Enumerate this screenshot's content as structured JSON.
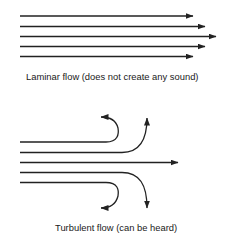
{
  "diagram": {
    "laminar": {
      "caption": "Laminar flow (does not create any sound)",
      "lines": [
        {
          "x1": 20,
          "y": 16,
          "x2": 193
        },
        {
          "x1": 20,
          "y": 26.5,
          "x2": 205
        },
        {
          "x1": 20,
          "y": 36.5,
          "x2": 216
        },
        {
          "x1": 20,
          "y": 46.5,
          "x2": 205
        },
        {
          "x1": 20,
          "y": 56.5,
          "x2": 193
        }
      ]
    },
    "turbulent": {
      "caption": "Turbulent flow (can be heard)",
      "streams": [
        {
          "type": "curl-up-back",
          "start_y": 142
        },
        {
          "type": "curve-up",
          "start_y": 152.5
        },
        {
          "type": "straight",
          "start_y": 162.5
        },
        {
          "type": "curve-down",
          "start_y": 172.5
        },
        {
          "type": "curl-down-back",
          "start_y": 182.5
        }
      ]
    },
    "colors": {
      "line": "#222222",
      "background": "#ffffff"
    }
  }
}
